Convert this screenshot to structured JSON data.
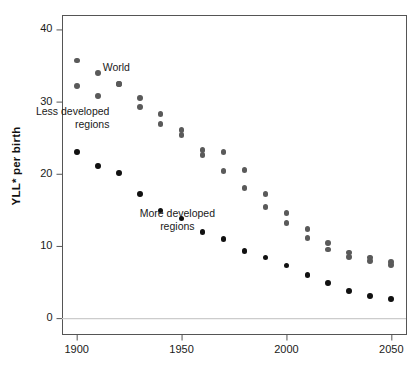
{
  "figure": {
    "title": "",
    "ylabel": "YLL* per birth",
    "xlabel": ""
  },
  "axes": {
    "y_ticks": [
      "0",
      "10",
      "20",
      "30",
      "40"
    ],
    "y_tick_values": [
      0,
      10,
      20,
      30,
      40
    ],
    "x_ticks": [
      "1900",
      "1950",
      "2000",
      "2050"
    ],
    "x_tick_values": [
      1900,
      1950,
      2000,
      2050
    ]
  },
  "annotations": [
    {
      "name": "world",
      "text": "World",
      "x": 1910,
      "y": 34.0,
      "align": "left",
      "dx": 5,
      "dy": -6
    },
    {
      "name": "less-developed-regions",
      "text": "Less developed\nregions",
      "x": 1918,
      "y": 26.6,
      "align": "right",
      "dx": -5,
      "dy": -8
    },
    {
      "name": "more-developed-regions",
      "text": "More developed\nregions",
      "x": 1948,
      "y": 12.6,
      "align": "center",
      "dx": 0,
      "dy": -7
    }
  ],
  "colors": {
    "world_series": "#5a5a5a",
    "less_developed_series": "#5a5a5a",
    "more_developed_series": "#111111",
    "frame": "#555555",
    "baseline": "#cccccc",
    "text": "#1a1a1a"
  },
  "chart_data": {
    "type": "scatter",
    "title": "",
    "xlabel": "",
    "ylabel": "YLL* per birth",
    "xlim": [
      1893,
      2057
    ],
    "ylim": [
      -2.2,
      42.0
    ],
    "grid": false,
    "legend": "inline-annotations",
    "x": [
      1900,
      1910,
      1920,
      1930,
      1940,
      1950,
      1960,
      1970,
      1980,
      1990,
      2000,
      2010,
      2020,
      2030,
      2040,
      2050
    ],
    "series": [
      {
        "name": "World",
        "color": "#5a5a5a",
        "values": [
          35.7,
          34.0,
          32.4,
          29.3,
          28.3,
          25.4,
          22.6,
          20.4,
          18.0,
          15.4,
          13.2,
          11.1,
          9.5,
          8.5,
          7.9,
          7.4
        ]
      },
      {
        "name": "Less developed regions",
        "color": "#5a5a5a",
        "values": [
          32.2,
          30.8,
          32.4,
          30.5,
          26.9,
          26.1,
          23.3,
          23.0,
          20.5,
          17.2,
          14.6,
          12.3,
          10.4,
          9.1,
          8.4,
          7.8
        ]
      },
      {
        "name": "More developed regions",
        "color": "#111111",
        "values": [
          23.0,
          21.1,
          20.1,
          17.2,
          14.9,
          13.8,
          11.9,
          11.0,
          9.3,
          8.4,
          7.3,
          6.0,
          4.9,
          3.8,
          3.1,
          2.6
        ]
      }
    ]
  }
}
